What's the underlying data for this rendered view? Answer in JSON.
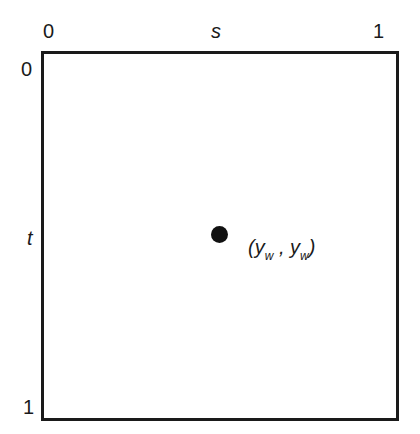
{
  "diagram": {
    "axis_s": {
      "label": "s",
      "start": "0",
      "end": "1"
    },
    "axis_t": {
      "label": "t",
      "start": "0",
      "end": "1"
    },
    "point": {
      "label_open": "(",
      "var1": "y",
      "sub1": "w",
      "sep": " , ",
      "var2": "y",
      "sub2": "w",
      "label_close": ")",
      "s": 0.5,
      "t": 0.5
    }
  }
}
